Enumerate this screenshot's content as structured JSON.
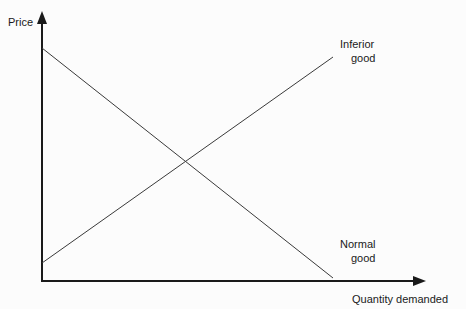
{
  "figure": {
    "width": 466,
    "height": 309,
    "background_color": "#fcfcfc",
    "axis_color": "#1a1a1a",
    "line_color": "#3a3a3a"
  },
  "chart_data": {
    "type": "line",
    "title": "",
    "subtitle": "",
    "xlabel": "Quantity demanded",
    "ylabel": "Price",
    "grid": false,
    "legend_position": "inline-endpoint-labels",
    "axes": {
      "x": {
        "label": "Quantity demanded",
        "ticks": [],
        "tick_labels": [],
        "arrow": true,
        "origin_px": [
          42,
          281
        ],
        "end_px": [
          425,
          281
        ]
      },
      "y": {
        "label": "Price",
        "ticks": [],
        "tick_labels": [],
        "arrow": true,
        "origin_px": [
          42,
          281
        ],
        "end_px": [
          42,
          12
        ]
      }
    },
    "series": [
      {
        "name": "Normal good",
        "slope": "negative",
        "description": "Downward sloping demand curve: quantity demanded falls as price rises",
        "points_px": [
          [
            42,
            48
          ],
          [
            333,
            278
          ]
        ],
        "label": "Normal\ngood",
        "label_line1": "Normal",
        "label_line2": "good",
        "label_px": [
          340,
          249
        ]
      },
      {
        "name": "Inferior good",
        "slope": "positive",
        "description": "Upward sloping line: quantity demanded rises as price rises",
        "points_px": [
          [
            42,
            263
          ],
          [
            333,
            57
          ]
        ],
        "label": "Inferior\ngood",
        "label_line1": "Inferior",
        "label_line2": "good",
        "label_px": [
          340,
          49
        ]
      }
    ],
    "intersection_px": [
      188,
      154
    ],
    "annotations": [
      {
        "text": "Inferior good",
        "at_px": [
          340,
          49
        ]
      },
      {
        "text": "Normal good",
        "at_px": [
          340,
          249
        ]
      }
    ]
  },
  "labels": {
    "y_axis": "Price",
    "x_axis": "Quantity demanded",
    "inferior_line1": "Inferior",
    "inferior_line2": "good",
    "normal_line1": "Normal",
    "normal_line2": "good"
  }
}
